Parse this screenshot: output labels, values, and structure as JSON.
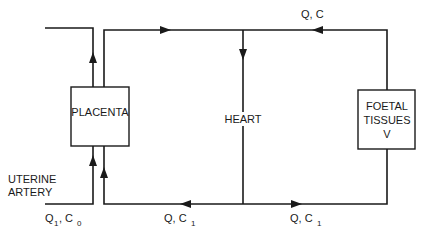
{
  "diagram": {
    "nodes": {
      "placenta": {
        "label": "PLACENTA"
      },
      "heart": {
        "label": "HEART"
      },
      "foetal_tissues": {
        "line1": "FOETAL",
        "line2": "TISSUES",
        "line3": "V"
      },
      "uterine_artery": {
        "line1": "UTERINE",
        "line2": "ARTERY"
      }
    },
    "flows": {
      "top_return": {
        "q": "Q, C"
      },
      "uterine_input": {
        "q": "Q",
        "q_sub": "1",
        "c": ", C",
        "c_sub": "0"
      },
      "bottom_left": {
        "q": "Q, C",
        "c_sub": "1"
      },
      "bottom_right": {
        "q": "Q, C",
        "c_sub": "1"
      }
    },
    "colors": {
      "stroke": "#1a1a1a",
      "background": "#ffffff"
    }
  }
}
